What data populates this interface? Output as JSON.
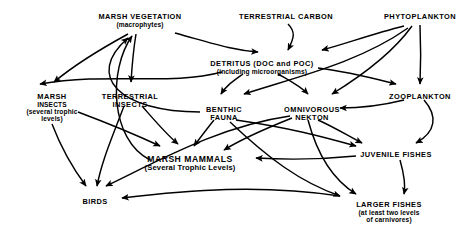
{
  "diagram": {
    "type": "food-web-flow-diagram",
    "background_color": "#ffffff",
    "line_color": "#000000",
    "nodes": [
      {
        "id": "marsh-vegetation",
        "title": "MARSH VEGETATION",
        "sub": "(macrophytes)",
        "x": 140,
        "y": 13,
        "size": "normal"
      },
      {
        "id": "terrestrial-carbon",
        "title": "TERRESTRIAL CARBON",
        "sub": "",
        "x": 286,
        "y": 13,
        "size": "normal"
      },
      {
        "id": "phytoplankton",
        "title": "PHYTOPLANKTON",
        "sub": "",
        "x": 420,
        "y": 13,
        "size": "normal"
      },
      {
        "id": "detritus",
        "title": "DETRITUS (DOC and POC)",
        "sub": "(including microorganisms)",
        "x": 262,
        "y": 60,
        "size": "normal"
      },
      {
        "id": "marsh-insects",
        "title": "MARSH",
        "sub": "INSECTS|(several trophic|levels)",
        "x": 52,
        "y": 93,
        "size": "normal"
      },
      {
        "id": "terrestrial-insects",
        "title": "TERRESTRIAL",
        "sub": "INSECTS",
        "x": 130,
        "y": 93,
        "size": "normal"
      },
      {
        "id": "benthic-fauna",
        "title": "BENTHIC",
        "sub": "FAUNA",
        "x": 224,
        "y": 106,
        "size": "normal"
      },
      {
        "id": "omnivorous-nekton",
        "title": "OMNIVOROUS",
        "sub": "NEKTON",
        "x": 312,
        "y": 106,
        "size": "normal"
      },
      {
        "id": "zooplankton",
        "title": "ZOOPLANKTON",
        "sub": "",
        "x": 420,
        "y": 93,
        "size": "normal"
      },
      {
        "id": "marsh-mammals",
        "title": "MARSH MAMMALS",
        "sub": "(Several Trophic Levels)",
        "x": 190,
        "y": 155,
        "size": "big"
      },
      {
        "id": "juvenile-fishes",
        "title": "JUVENILE FISHES",
        "sub": "",
        "x": 396,
        "y": 151,
        "size": "normal"
      },
      {
        "id": "birds",
        "title": "BIRDS",
        "sub": "",
        "x": 95,
        "y": 198,
        "size": "normal"
      },
      {
        "id": "larger-fishes",
        "title": "LARGER FISHES",
        "sub": "(at least two levels|of carnivores)",
        "x": 389,
        "y": 201,
        "size": "normal"
      }
    ],
    "edges": [
      {
        "from": "marsh-vegetation",
        "to": "detritus"
      },
      {
        "from": "marsh-vegetation",
        "to": "marsh-insects"
      },
      {
        "from": "marsh-vegetation",
        "to": "terrestrial-insects"
      },
      {
        "from": "terrestrial-carbon",
        "to": "detritus"
      },
      {
        "from": "phytoplankton",
        "to": "detritus"
      },
      {
        "from": "phytoplankton",
        "to": "zooplankton"
      },
      {
        "from": "phytoplankton",
        "to": "omnivorous-nekton"
      },
      {
        "from": "phytoplankton",
        "to": "benthic-fauna"
      },
      {
        "from": "detritus",
        "to": "benthic-fauna"
      },
      {
        "from": "detritus",
        "to": "omnivorous-nekton"
      },
      {
        "from": "detritus",
        "to": "zooplankton"
      },
      {
        "from": "detritus",
        "to": "marsh-insects"
      },
      {
        "from": "zooplankton",
        "to": "omnivorous-nekton"
      },
      {
        "from": "zooplankton",
        "to": "juvenile-fishes"
      },
      {
        "from": "benthic-fauna",
        "to": "marsh-mammals"
      },
      {
        "from": "benthic-fauna",
        "to": "juvenile-fishes"
      },
      {
        "from": "benthic-fauna",
        "to": "larger-fishes"
      },
      {
        "from": "omnivorous-nekton",
        "to": "juvenile-fishes"
      },
      {
        "from": "omnivorous-nekton",
        "to": "larger-fishes"
      },
      {
        "from": "omnivorous-nekton",
        "to": "marsh-mammals"
      },
      {
        "from": "omnivorous-nekton",
        "to": "birds"
      },
      {
        "from": "terrestrial-insects",
        "to": "birds"
      },
      {
        "from": "terrestrial-insects",
        "to": "marsh-mammals"
      },
      {
        "from": "marsh-insects",
        "to": "birds"
      },
      {
        "from": "marsh-insects",
        "to": "marsh-mammals"
      },
      {
        "from": "juvenile-fishes",
        "to": "larger-fishes"
      },
      {
        "from": "marsh-mammals",
        "to": "birds"
      },
      {
        "from": "juvenile-fishes",
        "to": "marsh-mammals"
      },
      {
        "from": "larger-fishes",
        "to": "birds"
      },
      {
        "from": "marsh-mammals",
        "to": "marsh-vegetation"
      },
      {
        "from": "benthic-fauna",
        "to": "marsh-vegetation"
      }
    ]
  }
}
